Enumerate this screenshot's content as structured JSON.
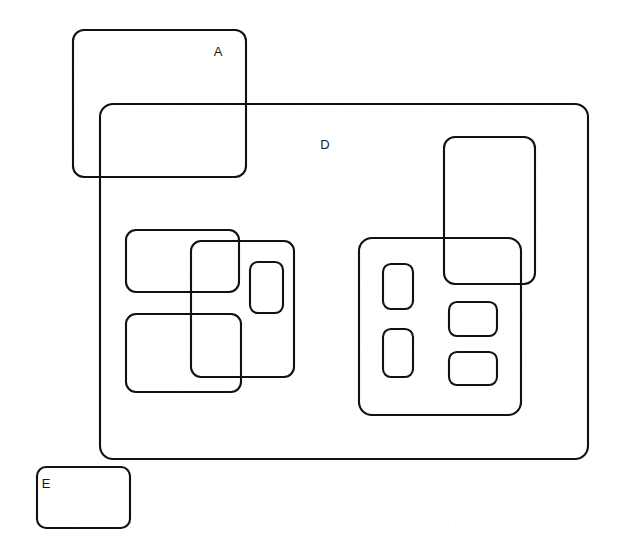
{
  "diagram": {
    "width": 622,
    "height": 556,
    "background_color": "#ffffff",
    "stroke_color": "#111111",
    "stroke_width": 2.1,
    "labels": [
      {
        "id": "label-a",
        "text": "A",
        "x": 218,
        "y": 53
      },
      {
        "id": "label-d",
        "text": "D",
        "x": 325,
        "y": 146
      },
      {
        "id": "label-e",
        "text": "E",
        "x": 46,
        "y": 485
      }
    ],
    "shapes": [
      {
        "id": "box-a",
        "name": "rect-a-top-left",
        "label": "A",
        "x": 73,
        "y": 30,
        "width": 173,
        "height": 147,
        "rx": 11
      },
      {
        "id": "box-d",
        "name": "rect-d-large-container",
        "label": "D",
        "x": 100,
        "y": 104,
        "width": 488,
        "height": 355,
        "rx": 13
      },
      {
        "id": "box-e",
        "name": "rect-e-bottom-left",
        "label": "E",
        "x": 37,
        "y": 467,
        "width": 93,
        "height": 61,
        "rx": 9
      },
      {
        "id": "box-left-upper",
        "name": "rect-left-group-upper",
        "label": "",
        "x": 126,
        "y": 230,
        "width": 113,
        "height": 62,
        "rx": 10
      },
      {
        "id": "box-left-lower",
        "name": "rect-left-group-lower",
        "label": "",
        "x": 126,
        "y": 314,
        "width": 115,
        "height": 78,
        "rx": 10
      },
      {
        "id": "box-left-tall",
        "name": "rect-left-group-tall-overlap",
        "label": "",
        "x": 191,
        "y": 241,
        "width": 103,
        "height": 136,
        "rx": 10
      },
      {
        "id": "box-left-small",
        "name": "rect-left-group-small-inner",
        "label": "",
        "x": 250,
        "y": 262,
        "width": 33,
        "height": 51,
        "rx": 8
      },
      {
        "id": "box-right-outer",
        "name": "rect-right-group-outer",
        "label": "",
        "x": 359,
        "y": 238,
        "width": 162,
        "height": 177,
        "rx": 13
      },
      {
        "id": "box-right-tall",
        "name": "rect-right-group-tall-overlap",
        "label": "",
        "x": 444,
        "y": 137,
        "width": 91,
        "height": 147,
        "rx": 11
      },
      {
        "id": "box-right-inner-1",
        "name": "rect-right-group-inner-upper-left",
        "label": "",
        "x": 383,
        "y": 264,
        "width": 30,
        "height": 45,
        "rx": 8
      },
      {
        "id": "box-right-inner-2",
        "name": "rect-right-group-inner-lower-left",
        "label": "",
        "x": 383,
        "y": 329,
        "width": 30,
        "height": 48,
        "rx": 8
      },
      {
        "id": "box-right-inner-3",
        "name": "rect-right-group-inner-upper-right",
        "label": "",
        "x": 449,
        "y": 302,
        "width": 48,
        "height": 34,
        "rx": 8
      },
      {
        "id": "box-right-inner-4",
        "name": "rect-right-group-inner-lower-right",
        "label": "",
        "x": 449,
        "y": 352,
        "width": 48,
        "height": 33,
        "rx": 8
      }
    ]
  }
}
